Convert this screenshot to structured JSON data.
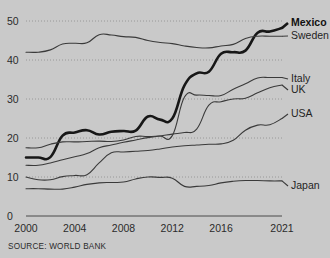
{
  "source": {
    "label": "SOURCE: WORLD BANK"
  },
  "axes": {
    "y_ticks": [
      "0",
      "10",
      "20",
      "30",
      "40",
      "50"
    ],
    "x_ticks": [
      "2000",
      "2004",
      "2008",
      "2012",
      "2016",
      "2021"
    ]
  },
  "legend": [
    {
      "name": "Mexico",
      "bold": true
    },
    {
      "name": "Sweden",
      "bold": false
    },
    {
      "name": "Italy",
      "bold": false
    },
    {
      "name": "UK",
      "bold": false
    },
    {
      "name": "USA",
      "bold": false
    },
    {
      "name": "Japan",
      "bold": false
    }
  ],
  "chart_data": {
    "type": "line",
    "title": "",
    "xlabel": "",
    "ylabel": "",
    "xlim": [
      2000,
      2021
    ],
    "ylim": [
      0,
      50
    ],
    "grid": true,
    "legend_position": "right-inline-labels",
    "x": [
      2000,
      2001,
      2002,
      2003,
      2004,
      2005,
      2006,
      2007,
      2008,
      2009,
      2010,
      2011,
      2012,
      2013,
      2014,
      2015,
      2016,
      2017,
      2018,
      2019,
      2020,
      2021
    ],
    "series": [
      {
        "name": "Mexico",
        "highlight": true,
        "end_value": 48.2,
        "values": [
          15.0,
          15.0,
          15.1,
          20.6,
          21.4,
          22.0,
          20.9,
          21.6,
          21.8,
          21.9,
          25.5,
          24.7,
          25.0,
          33.5,
          36.6,
          37.0,
          41.6,
          42.0,
          42.4,
          47.0,
          47.3,
          48.2
        ]
      },
      {
        "name": "Sweden",
        "highlight": false,
        "end_value": 46.1,
        "values": [
          42.0,
          42.0,
          42.6,
          44.1,
          44.3,
          44.4,
          46.5,
          46.4,
          46.0,
          45.8,
          45.0,
          44.5,
          44.2,
          43.6,
          43.2,
          43.1,
          43.6,
          44.0,
          45.5,
          46.1,
          46.1,
          46.1
        ]
      },
      {
        "name": "Italy",
        "highlight": false,
        "end_value": 35.5,
        "values": [
          17.5,
          17.5,
          18.4,
          19.0,
          19.0,
          19.1,
          19.2,
          19.1,
          19.5,
          20.4,
          20.4,
          20.5,
          20.6,
          30.5,
          31.0,
          30.9,
          30.9,
          32.5,
          33.9,
          35.4,
          35.5,
          35.5
        ]
      },
      {
        "name": "UK",
        "highlight": false,
        "end_value": 33.6,
        "values": [
          13.0,
          13.0,
          13.6,
          14.4,
          15.2,
          16.0,
          17.5,
          18.2,
          18.9,
          19.5,
          20.1,
          20.5,
          21.0,
          21.4,
          22.3,
          28.4,
          29.3,
          30.0,
          30.2,
          31.6,
          32.9,
          33.6
        ]
      },
      {
        "name": "USA",
        "highlight": false,
        "end_value": 25.0,
        "values": [
          10.0,
          9.3,
          9.3,
          10.1,
          10.4,
          10.6,
          13.6,
          16.2,
          16.4,
          16.6,
          16.8,
          17.2,
          17.7,
          18.0,
          18.2,
          18.4,
          18.5,
          19.4,
          22.0,
          23.3,
          23.4,
          25.0
        ]
      },
      {
        "name": "Japan",
        "highlight": false,
        "end_value": 9.0,
        "values": [
          7.0,
          7.0,
          6.9,
          6.9,
          7.4,
          8.1,
          8.5,
          8.6,
          8.7,
          9.5,
          10.0,
          9.9,
          9.7,
          7.6,
          7.6,
          7.8,
          8.5,
          8.9,
          9.1,
          9.1,
          9.0,
          9.0
        ]
      }
    ]
  }
}
